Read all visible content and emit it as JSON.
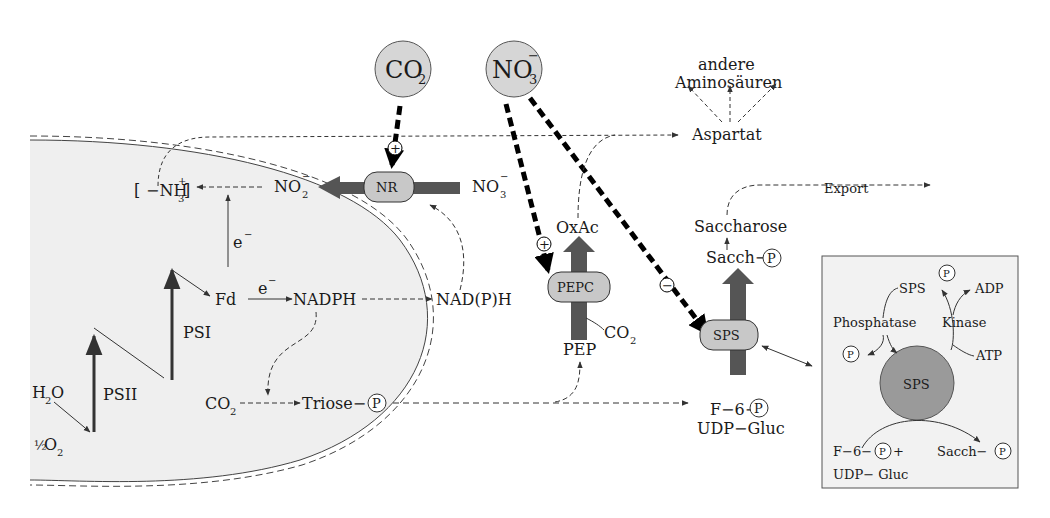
{
  "colors": {
    "chloroplast_fill": "#efefef",
    "enzyme_fill": "#c8c8c8",
    "molecule_circle_fill": "#d6d6d6",
    "thick_arrow": "#555555",
    "inset_fill": "#f2f2f2",
    "sps_circle_fill": "#9a9a9a"
  },
  "molecules": {
    "co2_top": "CO",
    "co2_top_sub": "2",
    "no3_top": "NO",
    "no3_top_sub": "3",
    "no3_top_sup": "−"
  },
  "labels": {
    "andere": "andere",
    "aminosaeuren": "Aminosäuren",
    "aspartat": "Aspartat",
    "export": "Export",
    "nh3_main": "−NH",
    "nh3_sub": "3",
    "nh3_sup": "+",
    "no2_main": "NO",
    "no2_sub": "2",
    "no2_sup": "−",
    "no3_main": "NO",
    "no3_sub": "3",
    "no3_sup": "−",
    "oxac": "OxAc",
    "saccharose": "Saccharose",
    "sacch_p": "Sacch−",
    "e1": "e",
    "e1_sup": "−",
    "e2": "e",
    "e2_sup": "−",
    "fd": "Fd",
    "nadph": "NADPH",
    "nadph_out": "NAD(P)H",
    "psi": "PSI",
    "psii": "PSII",
    "h2o": "H",
    "h2o_sub": "2",
    "h2o_o": "O",
    "half": "½",
    "o2": "O",
    "o2_sub": "2",
    "co2_in": "CO",
    "co2_in_sub": "2",
    "triose": "Triose−",
    "co2_pepc": "CO",
    "co2_pepc_sub": "2",
    "pep": "PEP",
    "f6p": "F−6−",
    "udp_gluc": "UDP−Gluc",
    "p": "P",
    "plus": "+",
    "minus": "−"
  },
  "enzymes": {
    "nr": "NR",
    "pepc": "PEPC",
    "sps": "SPS"
  },
  "inset": {
    "sps_p": "SPS",
    "adp": "ADP",
    "phosphatase": "Phosphatase",
    "kinase": "Kinase",
    "atp": "ATP",
    "sps_center": "SPS",
    "f6p": "F−6−",
    "plus": "+",
    "udp_gluc": "UDP− Gluc",
    "sacch_p": "Sacch−",
    "p": "P"
  }
}
